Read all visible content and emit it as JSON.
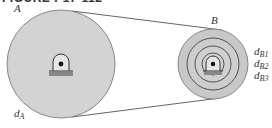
{
  "figure": {
    "title": "FIGURE P17-112"
  },
  "pulley_a": {
    "label": "A",
    "diameter_label": "d",
    "diameter_sub": "A"
  },
  "pulley_b": {
    "label": "B",
    "steps": [
      {
        "label": "d",
        "sub": "B1"
      },
      {
        "label": "d",
        "sub": "B2"
      },
      {
        "label": "d",
        "sub": "B3"
      }
    ]
  },
  "colors": {
    "pulley_fill": "#d3d3d3",
    "pulley_outline": "#777777",
    "step_rings": "#555555",
    "belt": "#555555",
    "bearing_base": "#888888"
  }
}
